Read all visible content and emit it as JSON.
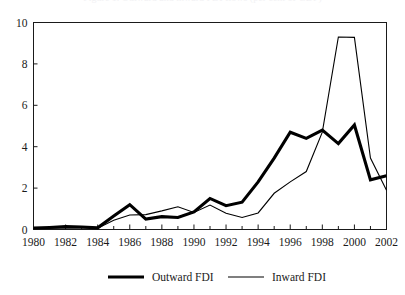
{
  "figure": {
    "title_remnant": "Figure 1.  Outward and inward FDI flows (per cent of GDP)",
    "background_color": "#ffffff",
    "line_color": "#000000"
  },
  "chart_data": {
    "type": "line",
    "title": "",
    "xlabel": "",
    "ylabel": "",
    "xlim": [
      1980,
      2002
    ],
    "ylim": [
      0,
      10
    ],
    "yticks": [
      0,
      2,
      4,
      6,
      8,
      10
    ],
    "ytick_labels": [
      "0",
      "2",
      "4",
      "6",
      "8",
      "10"
    ],
    "xticks": [
      1980,
      1982,
      1984,
      1986,
      1988,
      1990,
      1992,
      1994,
      1996,
      1998,
      2000,
      2002
    ],
    "xtick_labels": [
      "1980",
      "1982",
      "1984",
      "1986",
      "1988",
      "1990",
      "1992",
      "1994",
      "1996",
      "1998",
      "2000",
      "2002"
    ],
    "x_minor_tick_interval": 1,
    "grid": false,
    "legend_position": "bottom",
    "x": [
      1980,
      1981,
      1982,
      1983,
      1984,
      1985,
      1986,
      1987,
      1988,
      1989,
      1990,
      1991,
      1992,
      1993,
      1994,
      1995,
      1996,
      1997,
      1998,
      1999,
      2000,
      2001,
      2002
    ],
    "series": [
      {
        "name": "Outward FDI",
        "style": "thick",
        "color": "#000000",
        "values": [
          0.07,
          0.1,
          0.14,
          0.12,
          0.08,
          0.65,
          1.2,
          0.5,
          0.62,
          0.58,
          0.85,
          1.5,
          1.15,
          1.32,
          2.3,
          3.45,
          4.7,
          4.4,
          4.8,
          4.15,
          5.05,
          2.4,
          2.6
        ]
      },
      {
        "name": "Inward FDI",
        "style": "thin",
        "color": "#000000",
        "values": [
          0.05,
          0.06,
          0.08,
          0.07,
          0.06,
          0.45,
          0.7,
          0.72,
          0.9,
          1.1,
          0.82,
          1.18,
          0.78,
          0.58,
          0.8,
          1.75,
          2.3,
          2.8,
          4.7,
          9.3,
          9.28,
          3.45,
          1.9
        ]
      }
    ]
  },
  "legend": {
    "items": [
      {
        "label": "Outward FDI",
        "style": "thick"
      },
      {
        "label": "Inward FDI",
        "style": "thin"
      }
    ]
  }
}
